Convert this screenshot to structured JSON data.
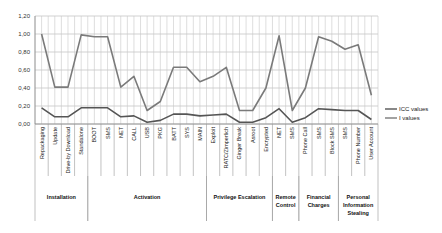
{
  "chart_data": {
    "type": "line",
    "title": "",
    "xlabel": "",
    "ylabel": "",
    "ylim": [
      0,
      1.2
    ],
    "yticks": [
      "0,00",
      "0,20",
      "0,40",
      "0,60",
      "0,80",
      "1,00",
      "1,20"
    ],
    "grid": true,
    "legend_position": "right",
    "categories": [
      "Repackaging",
      "Update",
      "Drive-by Download",
      "Standalone",
      "BOOT",
      "SMS",
      "NET",
      "CALL",
      "USB",
      "PKG",
      "BATT",
      "SYS",
      "MAIN",
      "Exploit",
      "RATC/Zimperlich",
      "Ginger Break",
      "Asroot",
      "Encrypted",
      "NET",
      "SMS",
      "Phone Call",
      "SMS",
      "Block SMS",
      "SMS",
      "Phone Number",
      "User Account"
    ],
    "groups": [
      {
        "label": "Installation",
        "start": 0,
        "end": 3
      },
      {
        "label": "Activation",
        "start": 4,
        "end": 12
      },
      {
        "label": "Privilege Escalation",
        "start": 13,
        "end": 17
      },
      {
        "label": "Remote Control",
        "start": 18,
        "end": 19
      },
      {
        "label": "Financial Charges",
        "start": 20,
        "end": 22
      },
      {
        "label": "Personal Information Stealing",
        "start": 23,
        "end": 25
      }
    ],
    "series": [
      {
        "name": "ICC values",
        "color": "#555555",
        "values": [
          0.18,
          0.08,
          0.08,
          0.18,
          0.18,
          0.18,
          0.08,
          0.09,
          0.02,
          0.04,
          0.11,
          0.11,
          0.09,
          0.1,
          0.11,
          0.02,
          0.02,
          0.07,
          0.17,
          0.02,
          0.07,
          0.17,
          0.16,
          0.15,
          0.15,
          0.05
        ]
      },
      {
        "name": "I values",
        "color": "#7a7a7a",
        "values": [
          1.0,
          0.41,
          0.41,
          0.99,
          0.97,
          0.97,
          0.41,
          0.53,
          0.15,
          0.25,
          0.63,
          0.63,
          0.47,
          0.53,
          0.63,
          0.15,
          0.15,
          0.4,
          0.98,
          0.15,
          0.4,
          0.97,
          0.92,
          0.83,
          0.88,
          0.32
        ]
      }
    ]
  },
  "legend": {
    "items": [
      "ICC values",
      "I values"
    ]
  }
}
